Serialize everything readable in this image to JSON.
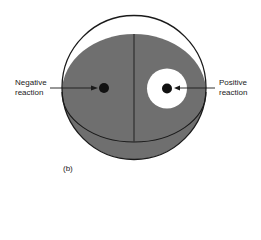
{
  "figure": {
    "panel_label": "(b)",
    "labels": {
      "negative_line1": "Negative",
      "negative_line2": "reaction",
      "positive_line1": "Positive",
      "positive_line2": "reaction"
    },
    "colors": {
      "medium": "#6f6f6f",
      "outline": "#1a1a1a",
      "zone": "#ffffff",
      "disk": "#111111"
    }
  }
}
